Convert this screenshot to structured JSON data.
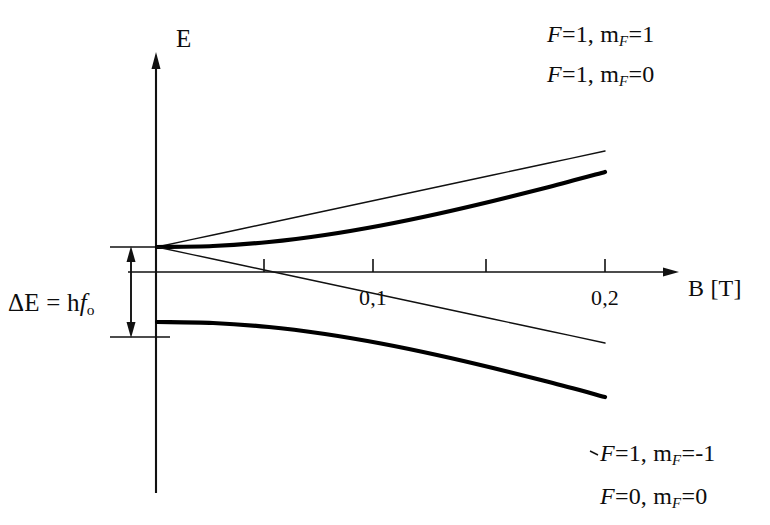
{
  "figure": {
    "background": "#ffffff",
    "ink_color": "#111111"
  },
  "axes": {
    "y_label": "E",
    "x_label": "B [T]",
    "x_ticks": [
      {
        "value": 0.05,
        "label": ""
      },
      {
        "value": 0.1,
        "label": "0,1"
      },
      {
        "value": 0.15,
        "label": ""
      },
      {
        "value": 0.2,
        "label": "0,2"
      }
    ]
  },
  "annotation": {
    "gap_label_prefix": "ΔE = h",
    "gap_label_italic": "f",
    "gap_label_sub": "o",
    "gap_label_full": "ΔE = hf_o"
  },
  "curves": [
    {
      "id": "f1-mf1",
      "label_F": "F",
      "label_F_value": "1",
      "label_m": "m",
      "label_m_sub": "F",
      "label_m_value": "1",
      "label_full": "F = 1, m_F = 1",
      "weight": "thin",
      "label_x": 547,
      "label_y": 22
    },
    {
      "id": "f1-mf0",
      "label_F": "F",
      "label_F_value": "1",
      "label_m": "m",
      "label_m_sub": "F",
      "label_m_value": "0",
      "label_full": "F = 1, m_F = 0",
      "weight": "thick",
      "label_x": 547,
      "label_y": 62
    },
    {
      "id": "f1-mfm1",
      "label_F": "F",
      "label_F_value": "1",
      "label_m": "m",
      "label_m_sub": "F",
      "label_m_value": "-1",
      "label_full": "F = 1, m_F = -1",
      "weight": "thin",
      "label_x": 600,
      "label_y": 441
    },
    {
      "id": "f0-mf0",
      "label_F": "F",
      "label_F_value": "0",
      "label_m": "m",
      "label_m_sub": "F",
      "label_m_value": "0",
      "label_full": "F = 0, m_F = 0",
      "weight": "thick",
      "label_x": 600,
      "label_y": 484
    }
  ],
  "chart_data": {
    "type": "line",
    "xlabel": "B [T]",
    "ylabel": "E",
    "xlim": [
      0,
      0.235
    ],
    "ylim": [
      -1.9,
      2.6
    ],
    "grid": false,
    "legend": "inline-end-labels",
    "xticks": [
      0.05,
      0.1,
      0.15,
      0.2
    ],
    "xticklabels": [
      "",
      "0,1",
      "",
      "0,2"
    ],
    "annotations": [
      {
        "text": "ΔE = hf_o",
        "kind": "double-headed-arrow",
        "from_y": 0.5,
        "to_y": -1.0,
        "at_x": -0.008,
        "meaning": "zero-field hyperfine splitting between F=1 and F=0"
      }
    ],
    "series": [
      {
        "name": "F = 1, m_F = 1",
        "weight": "thin",
        "shape": "linear-increasing",
        "x": [
          0.0,
          0.025,
          0.05,
          0.075,
          0.1,
          0.125,
          0.15,
          0.175,
          0.2
        ],
        "y": [
          0.5,
          0.74,
          0.98,
          1.22,
          1.46,
          1.7,
          1.94,
          2.18,
          2.42
        ]
      },
      {
        "name": "F = 1, m_F = 0",
        "weight": "thick",
        "shape": "quadratic-increasing",
        "x": [
          0.0,
          0.025,
          0.05,
          0.075,
          0.1,
          0.125,
          0.15,
          0.175,
          0.2
        ],
        "y": [
          0.5,
          0.52,
          0.6,
          0.74,
          0.93,
          1.16,
          1.42,
          1.7,
          2.0
        ]
      },
      {
        "name": "F = 1, m_F = -1",
        "weight": "thin",
        "shape": "linear-decreasing",
        "x": [
          0.0,
          0.025,
          0.05,
          0.075,
          0.1,
          0.125,
          0.15,
          0.175,
          0.2
        ],
        "y": [
          0.5,
          0.26,
          0.02,
          -0.22,
          -0.46,
          -0.7,
          -0.94,
          -1.18,
          -1.42
        ]
      },
      {
        "name": "F = 0, m_F = 0",
        "weight": "thick",
        "shape": "quadratic-decreasing",
        "x": [
          0.0,
          0.025,
          0.05,
          0.075,
          0.1,
          0.125,
          0.15,
          0.175,
          0.2
        ],
        "y": [
          -1.0,
          -1.02,
          -1.1,
          -1.24,
          -1.43,
          -1.66,
          -1.92,
          -2.2,
          -2.5
        ]
      }
    ]
  }
}
